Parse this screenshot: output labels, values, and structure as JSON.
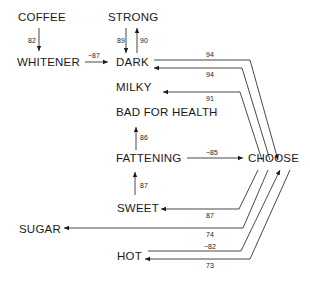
{
  "diagram": {
    "nodes": {
      "coffee": "COFFEE",
      "strong": "STRONG",
      "whitener": "WHITENER",
      "dark": "DARK",
      "milky": "MILKY",
      "bad_for_health": "BAD FOR HEALTH",
      "fattening": "FATTENING",
      "choose": "CHOOSE",
      "sweet": "SWEET",
      "sugar": "SUGAR",
      "hot": "HOT"
    },
    "weights": {
      "coffee_whitener": "82",
      "strong_dark": "89",
      "dark_strong": "90",
      "whitener_dark": "−87",
      "dark_choose": "94",
      "choose_dark": "94",
      "choose_milky": "91",
      "fattening_bad": "86",
      "fattening_choose": "−85",
      "sweet_fattening": "87",
      "choose_sweet": "87",
      "choose_sugar": "74",
      "hot_choose": "−82",
      "choose_hot": "73"
    },
    "edges": [
      {
        "from": "COFFEE",
        "to": "WHITENER",
        "weight": 82
      },
      {
        "from": "STRONG",
        "to": "DARK",
        "weight": 89
      },
      {
        "from": "DARK",
        "to": "STRONG",
        "weight": 90
      },
      {
        "from": "WHITENER",
        "to": "DARK",
        "weight": -87
      },
      {
        "from": "DARK",
        "to": "CHOOSE",
        "weight": 94
      },
      {
        "from": "CHOOSE",
        "to": "DARK",
        "weight": 94
      },
      {
        "from": "CHOOSE",
        "to": "MILKY",
        "weight": 91
      },
      {
        "from": "FATTENING",
        "to": "BAD FOR HEALTH",
        "weight": 86
      },
      {
        "from": "FATTENING",
        "to": "CHOOSE",
        "weight": -85
      },
      {
        "from": "SWEET",
        "to": "FATTENING",
        "weight": 87
      },
      {
        "from": "CHOOSE",
        "to": "SWEET",
        "weight": 87
      },
      {
        "from": "CHOOSE",
        "to": "SUGAR",
        "weight": 74
      },
      {
        "from": "HOT",
        "to": "CHOOSE",
        "weight": -82
      },
      {
        "from": "CHOOSE",
        "to": "HOT",
        "weight": 73
      }
    ]
  }
}
